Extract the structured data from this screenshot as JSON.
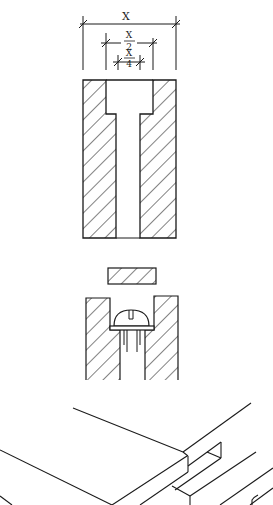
{
  "diagram": {
    "type": "technical-drawing",
    "colors": {
      "ink": "#1a1a1a",
      "background": "#ffffff"
    },
    "dimensions": {
      "total_width": "X",
      "counterbore_numerator": "X",
      "counterbore_denominator": "2",
      "hole_numerator": "X",
      "hole_denominator": "4"
    },
    "views": [
      {
        "id": "section-counterbore",
        "label": "Section of block with counterbored hole"
      },
      {
        "id": "plug",
        "label": "Hatched plug"
      },
      {
        "id": "section-screw",
        "label": "Section with screw head seated in counterbore"
      },
      {
        "id": "isometric-joint",
        "label": "Isometric view of board joint"
      }
    ]
  }
}
